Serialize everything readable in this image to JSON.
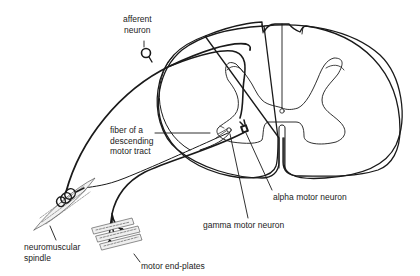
{
  "diagram": {
    "colors": {
      "ink": "#1a1a1a",
      "text": "#222222",
      "background": "#ffffff",
      "muscle_fill": "#e8e8e8"
    },
    "labels": {
      "afferent_neuron_line1": "afferent",
      "afferent_neuron_line2": "neuron",
      "descending_tract_line1": "fiber of a",
      "descending_tract_line2": "descending",
      "descending_tract_line3": "motor tract",
      "alpha_motor_neuron": "alpha motor neuron",
      "gamma_motor_neuron": "gamma motor neuron",
      "neuromuscular_spindle_line1": "neuromuscular",
      "neuromuscular_spindle_line2": "spindle",
      "motor_end_plates": "motor end-plates"
    },
    "structures": [
      "spinal-cord-cross-section",
      "gray-matter-butterfly",
      "central-canal",
      "afferent-neuron-cell-body",
      "afferent-fiber",
      "descending-tract-fiber",
      "alpha-motor-neuron",
      "gamma-motor-neuron",
      "neuromuscular-spindle",
      "muscle-fibers-with-end-plates"
    ]
  }
}
